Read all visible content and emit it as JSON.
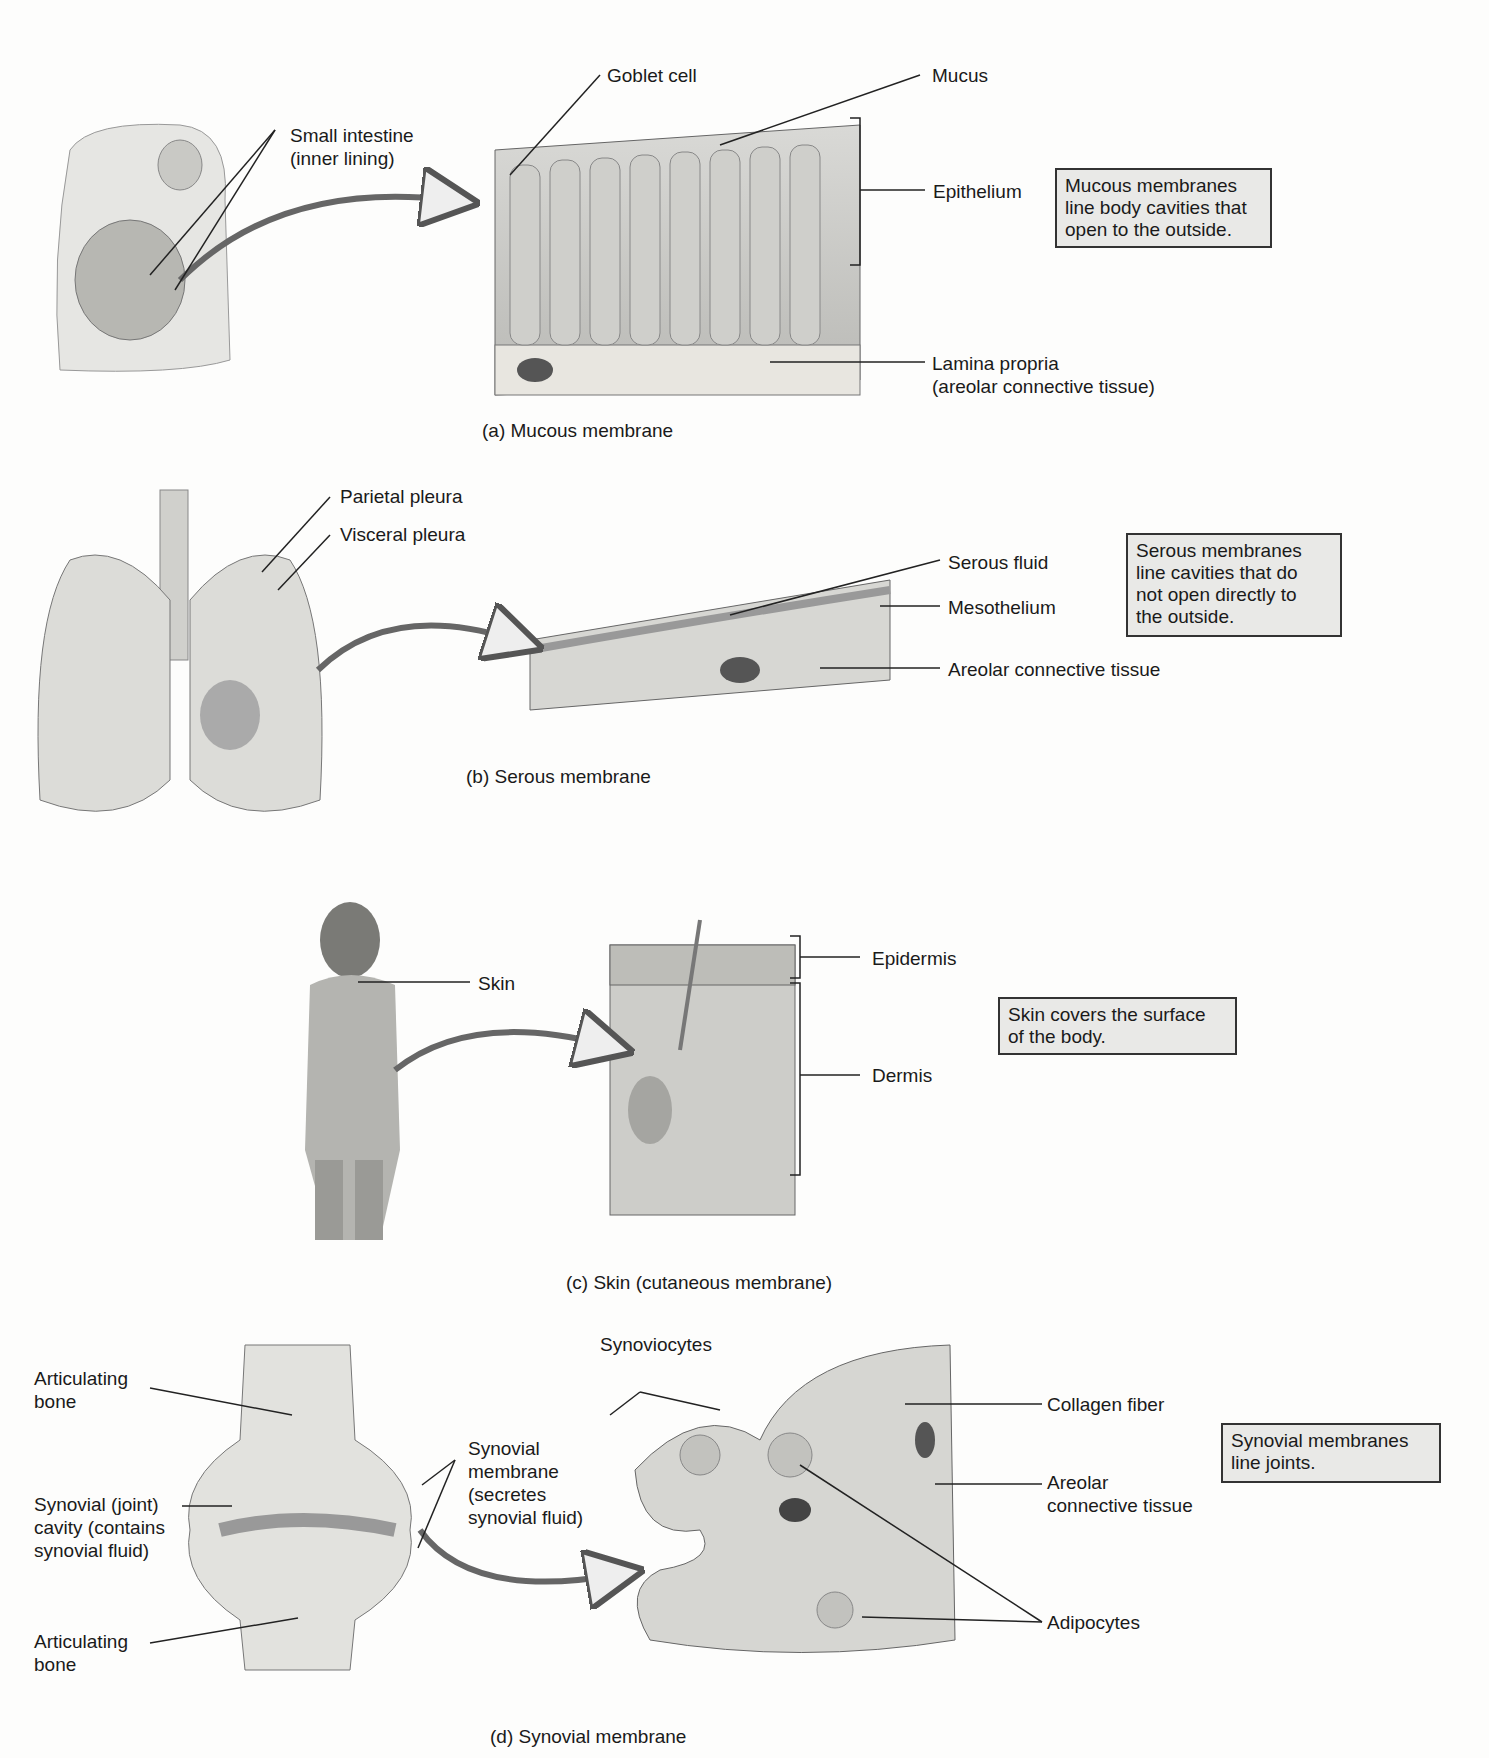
{
  "panels": [
    {
      "id": "a",
      "caption": "(a)  Mucous membrane",
      "labels": {
        "small_intestine": "Small intestine\n(inner lining)",
        "goblet_cell": "Goblet cell",
        "mucus": "Mucus",
        "epithelium": "Epithelium",
        "lamina_propria": "Lamina propria\n(areolar connective tissue)"
      },
      "note": "Mucous membranes\nline body cavities that\nopen to the outside."
    },
    {
      "id": "b",
      "caption": "(b)  Serous membrane",
      "labels": {
        "parietal_pleura": "Parietal pleura",
        "visceral_pleura": "Visceral pleura",
        "serous_fluid": "Serous fluid",
        "mesothelium": "Mesothelium",
        "areolar": "Areolar connective tissue"
      },
      "note": "Serous  membranes\nline cavities that do\nnot open directly to\nthe outside."
    },
    {
      "id": "c",
      "caption": "(c)  Skin (cutaneous membrane)",
      "labels": {
        "skin": "Skin",
        "epidermis": "Epidermis",
        "dermis": "Dermis"
      },
      "note": "Skin covers the surface\nof the body."
    },
    {
      "id": "d",
      "caption": "(d)  Synovial membrane",
      "labels": {
        "articulating_bone_top": "Articulating\nbone",
        "synovial_cavity": "Synovial (joint)\ncavity (contains\nsynovial fluid)",
        "articulating_bone_bottom": "Articulating\nbone",
        "synovial_membrane": "Synovial\nmembrane\n(secretes\nsynovial fluid)",
        "synoviocytes": "Synoviocytes",
        "collagen_fiber": "Collagen fiber",
        "areolar": "Areolar\nconnective tissue",
        "adipocytes": "Adipocytes"
      },
      "note": "Synovial membranes\nline joints."
    }
  ]
}
